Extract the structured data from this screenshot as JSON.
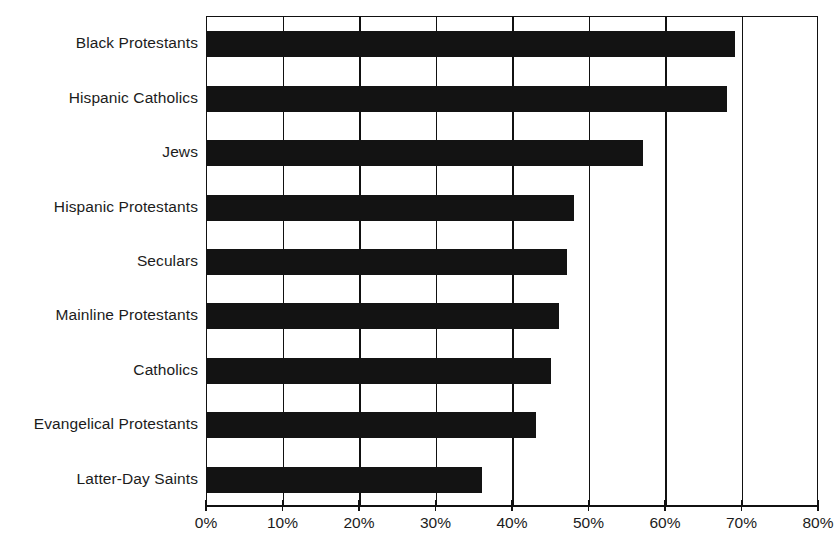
{
  "chart_data": {
    "type": "bar",
    "orientation": "horizontal",
    "title": "",
    "xlabel": "",
    "ylabel": "",
    "xlim": [
      0,
      80
    ],
    "grid": true,
    "legend": false,
    "value_suffix": "%",
    "categories": [
      "Black Protestants",
      "Hispanic Catholics",
      "Jews",
      "Hispanic Protestants",
      "Seculars",
      "Mainline Protestants",
      "Catholics",
      "Evangelical Protestants",
      "Latter-Day Saints"
    ],
    "values": [
      69,
      68,
      57,
      48,
      47,
      46,
      45,
      43,
      36
    ],
    "xticks": [
      0,
      10,
      20,
      30,
      40,
      50,
      60,
      70,
      80
    ],
    "xticklabels": [
      "0%",
      "10%",
      "20%",
      "30%",
      "40%",
      "50%",
      "60%",
      "70%",
      "80%"
    ],
    "bar_color": "#131313"
  },
  "bottom_caption": "",
  "colors": {
    "bar": "#131313",
    "axis": "#111111",
    "text": "#1c1c1c",
    "background": "#ffffff"
  }
}
